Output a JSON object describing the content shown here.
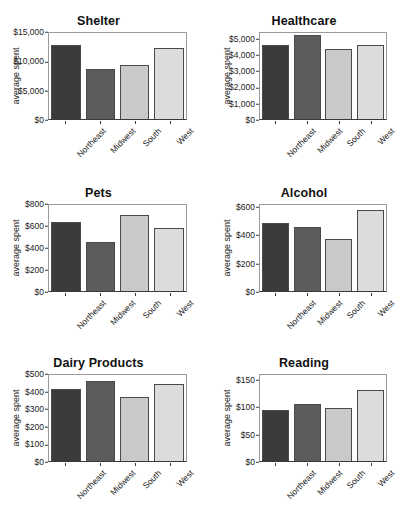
{
  "figure": {
    "categories": [
      "Northeast",
      "Midwest",
      "South",
      "West"
    ],
    "ylabel": "average spent",
    "bar_colors": [
      "#3b3b3b",
      "#5c5c5c",
      "#c9c9c9",
      "#dcdcdc"
    ]
  },
  "panels": [
    {
      "title": "Shelter",
      "ylabel": "average spent",
      "ticks": [
        "$0",
        "$5,000",
        "$10,000",
        "$15,000"
      ],
      "tick_values": [
        0,
        5000,
        10000,
        15000
      ],
      "ymax": 15000,
      "values": [
        12700,
        8600,
        9150,
        12150
      ]
    },
    {
      "title": "Healthcare",
      "ylabel": "average spent",
      "ticks": [
        "$0",
        "$1,000",
        "$2,000",
        "$3,000",
        "$4,000",
        "$5,000"
      ],
      "tick_values": [
        0,
        1000,
        2000,
        3000,
        4000,
        5000
      ],
      "ymax": 5400,
      "values": [
        4560,
        5180,
        4320,
        4570
      ]
    },
    {
      "title": "Pets",
      "ylabel": "average spent",
      "ticks": [
        "$0",
        "$200",
        "$400",
        "$600",
        "$800"
      ],
      "tick_values": [
        0,
        200,
        400,
        600,
        800
      ],
      "ymax": 800,
      "values": [
        625,
        445,
        690,
        570
      ]
    },
    {
      "title": "Alcohol",
      "ylabel": "average spent",
      "ticks": [
        "$0",
        "$200",
        "$400",
        "$600"
      ],
      "tick_values": [
        0,
        200,
        400,
        600
      ],
      "ymax": 620,
      "values": [
        480,
        448,
        368,
        568
      ]
    },
    {
      "title": "Dairy Products",
      "ylabel": "average spent",
      "ticks": [
        "$0",
        "$100",
        "$200",
        "$300",
        "$400",
        "$500"
      ],
      "tick_values": [
        0,
        100,
        200,
        300,
        400,
        500
      ],
      "ymax": 500,
      "values": [
        410,
        452,
        365,
        435
      ]
    },
    {
      "title": "Reading",
      "ylabel": "average spent",
      "ticks": [
        "$0",
        "$50",
        "$100",
        "$150"
      ],
      "tick_values": [
        0,
        50,
        100,
        150
      ],
      "ymax": 160,
      "values": [
        93,
        103,
        96,
        129
      ]
    }
  ],
  "chart_data": {
    "type": "bar",
    "title": "",
    "categories": [
      "Northeast",
      "Midwest",
      "South",
      "West"
    ],
    "xlabel": "",
    "ylabel": "average spent",
    "grid": false,
    "legend": "none",
    "panels": [
      {
        "title": "Shelter",
        "ylabel": "average spent",
        "ylim": [
          0,
          15000
        ],
        "yticks": [
          0,
          5000,
          10000,
          15000
        ],
        "ytick_labels": [
          "$0",
          "$5,000",
          "$10,000",
          "$15,000"
        ],
        "categories": [
          "Northeast",
          "Midwest",
          "South",
          "West"
        ],
        "values": [
          12700,
          8600,
          9150,
          12150
        ]
      },
      {
        "title": "Healthcare",
        "ylabel": "average spent",
        "ylim": [
          0,
          5400
        ],
        "yticks": [
          0,
          1000,
          2000,
          3000,
          4000,
          5000
        ],
        "ytick_labels": [
          "$0",
          "$1,000",
          "$2,000",
          "$3,000",
          "$4,000",
          "$5,000"
        ],
        "categories": [
          "Northeast",
          "Midwest",
          "South",
          "West"
        ],
        "values": [
          4560,
          5180,
          4320,
          4570
        ]
      },
      {
        "title": "Pets",
        "ylabel": "average spent",
        "ylim": [
          0,
          800
        ],
        "yticks": [
          0,
          200,
          400,
          600,
          800
        ],
        "ytick_labels": [
          "$0",
          "$200",
          "$400",
          "$600",
          "$800"
        ],
        "categories": [
          "Northeast",
          "Midwest",
          "South",
          "West"
        ],
        "values": [
          625,
          445,
          690,
          570
        ]
      },
      {
        "title": "Alcohol",
        "ylabel": "average spent",
        "ylim": [
          0,
          620
        ],
        "yticks": [
          0,
          200,
          400,
          600
        ],
        "ytick_labels": [
          "$0",
          "$200",
          "$400",
          "$600"
        ],
        "categories": [
          "Northeast",
          "Midwest",
          "South",
          "West"
        ],
        "values": [
          480,
          448,
          368,
          568
        ]
      },
      {
        "title": "Dairy Products",
        "ylabel": "average spent",
        "ylim": [
          0,
          500
        ],
        "yticks": [
          0,
          100,
          200,
          300,
          400,
          500
        ],
        "ytick_labels": [
          "$0",
          "$100",
          "$200",
          "$300",
          "$400",
          "$500"
        ],
        "categories": [
          "Northeast",
          "Midwest",
          "South",
          "West"
        ],
        "values": [
          410,
          452,
          365,
          435
        ]
      },
      {
        "title": "Reading",
        "ylabel": "average spent",
        "ylim": [
          0,
          160
        ],
        "yticks": [
          0,
          50,
          100,
          150
        ],
        "ytick_labels": [
          "$0",
          "$50",
          "$100",
          "$150"
        ],
        "categories": [
          "Northeast",
          "Midwest",
          "South",
          "West"
        ],
        "values": [
          93,
          103,
          96,
          129
        ]
      }
    ]
  }
}
